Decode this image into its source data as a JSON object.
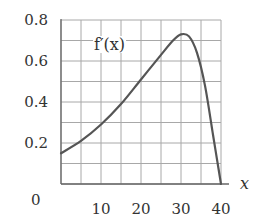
{
  "chart_data": {
    "type": "line",
    "title": "",
    "xlabel": "x",
    "ylabel": "",
    "xlim": [
      0,
      40
    ],
    "ylim": [
      0,
      0.8
    ],
    "grid": true,
    "x_grid_step": 5,
    "y_grid_step": 0.1,
    "x_ticks": [
      10,
      20,
      30,
      40
    ],
    "x_tick_labels": [
      "10",
      "20",
      "30",
      "40"
    ],
    "y_ticks": [
      0.2,
      0.4,
      0.6,
      0.8
    ],
    "y_tick_labels": [
      "0.2",
      "0.4",
      "0.6",
      "0.8"
    ],
    "origin_label": "0",
    "series": [
      {
        "name": "f'(x)",
        "label": "f′(x)",
        "color": "#555555",
        "x": [
          0,
          5,
          10,
          15,
          20,
          25,
          28,
          30,
          32,
          34,
          36,
          38,
          39,
          40
        ],
        "values": [
          0.15,
          0.21,
          0.29,
          0.39,
          0.51,
          0.63,
          0.7,
          0.73,
          0.72,
          0.64,
          0.48,
          0.24,
          0.12,
          0.0
        ]
      }
    ],
    "annotations": [
      {
        "text": "f′(x)",
        "x": 9,
        "y": 0.69
      }
    ]
  },
  "colors": {
    "grid": "#a8a8a8",
    "axis": "#666666",
    "curve": "#555555",
    "text": "#333333"
  }
}
